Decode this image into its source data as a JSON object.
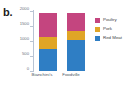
{
  "panel": {
    "label": "b."
  },
  "chart_data": {
    "type": "bar",
    "stacked": true,
    "title": "",
    "xlabel": "",
    "ylabel": "",
    "categories": [
      "Bianchini's",
      "Foodville"
    ],
    "series": [
      {
        "name": "Red Meat",
        "color": "#2f7ec4",
        "values": [
          750,
          1050
        ]
      },
      {
        "name": "Pork",
        "color": "#e0a526",
        "values": [
          400,
          300
        ]
      },
      {
        "name": "Poultry",
        "color": "#c4457f",
        "values": [
          800,
          600
        ]
      }
    ],
    "ylim": [
      0,
      2000
    ],
    "yticks": [
      0,
      500,
      1000,
      1500,
      2000
    ],
    "ytick_labels": [
      "0",
      "500",
      "1000",
      "1500",
      "2000"
    ],
    "grid": false,
    "legend_position": "right",
    "legend_entries": [
      "Poultry",
      "Pork",
      "Red Meat"
    ]
  }
}
